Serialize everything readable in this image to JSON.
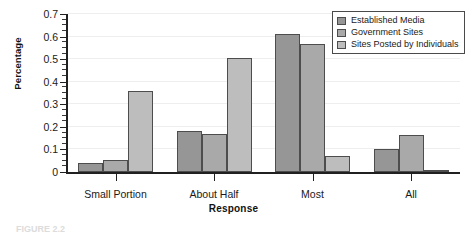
{
  "chart_data": {
    "type": "bar",
    "title": "",
    "xlabel": "Response",
    "ylabel": "Percentage",
    "categories": [
      "Small Portion",
      "About Half",
      "Most",
      "All"
    ],
    "series": [
      {
        "name": "Established Media",
        "color": "#969696",
        "values": [
          0.04,
          0.18,
          0.61,
          0.1
        ]
      },
      {
        "name": "Government Sites",
        "color": "#a9a9a9",
        "values": [
          0.055,
          0.17,
          0.565,
          0.165
        ]
      },
      {
        "name": "Sites Posted by Individuals",
        "color": "#bdbdbd",
        "values": [
          0.36,
          0.505,
          0.07,
          0.005
        ]
      }
    ],
    "ylim": [
      0,
      0.7
    ],
    "ytick_labels": [
      "0",
      "0.1",
      "0.2",
      "0.3",
      "0.4",
      "0.5",
      "0.6",
      "0.7"
    ],
    "ytick_values": [
      0,
      0.1,
      0.2,
      0.3,
      0.4,
      0.5,
      0.6,
      0.7
    ],
    "yminor_step": 0.025,
    "grid": true,
    "grid_color": "#eeeeee",
    "legend_position": "top-right",
    "bar_edge_color": "#4d4d4d",
    "axis_color": "#202020"
  },
  "axes": {
    "ylabel": "Percentage",
    "xlabel": "Response"
  },
  "legend": {
    "entries": [
      {
        "label": "Established Media",
        "color": "#969696"
      },
      {
        "label": "Government Sites",
        "color": "#a9a9a9"
      },
      {
        "label": "Sites Posted by Individuals",
        "color": "#bdbdbd"
      }
    ]
  },
  "caption": "FIGURE 2.2"
}
